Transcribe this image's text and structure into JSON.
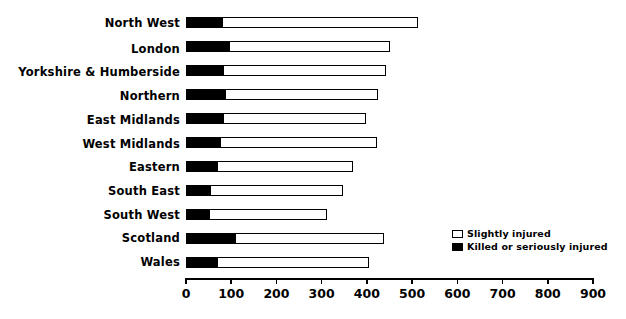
{
  "chart_data": {
    "type": "bar",
    "orientation": "horizontal",
    "stacked": true,
    "title": "",
    "subtitle": "",
    "xlabel": "",
    "ylabel": "",
    "xlim": [
      0,
      900
    ],
    "grid": false,
    "legend_position": "inside-right",
    "categories": [
      "North West",
      "London",
      "Yorkshire & Humberside",
      "Northern",
      "East Midlands",
      "West Midlands",
      "Eastern",
      "South East",
      "South West",
      "Scotland",
      "Wales"
    ],
    "series": [
      {
        "name": "Killed or seriously injured",
        "color": "#000000",
        "values": [
          80,
          95,
          82,
          86,
          82,
          76,
          69,
          54,
          51,
          108,
          69
        ]
      },
      {
        "name": "Slightly injured",
        "color": "#ffffff",
        "values": [
          433,
          356,
          361,
          339,
          316,
          346,
          300,
          293,
          261,
          330,
          336
        ]
      }
    ],
    "totals": [
      513,
      451,
      443,
      425,
      398,
      422,
      369,
      347,
      312,
      438,
      405
    ],
    "xticks": [
      0,
      100,
      200,
      300,
      400,
      500,
      600,
      700,
      800,
      900
    ],
    "xticklabels": [
      "0",
      "100",
      "200",
      "300",
      "400",
      "500",
      "600",
      "700",
      "800",
      "900"
    ]
  },
  "legend": {
    "items": [
      {
        "label": "Slightly injured",
        "swatch": "hollow"
      },
      {
        "label": "Killed or seriously injured",
        "swatch": "filled"
      }
    ]
  }
}
